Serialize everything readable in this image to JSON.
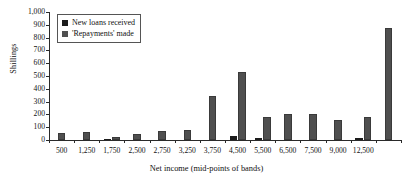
{
  "chart_data": {
    "type": "bar",
    "title": "",
    "xlabel": "Net income (mid-points of bands)",
    "ylabel": "Shillings",
    "ylim": [
      0,
      1000
    ],
    "yticks": [
      "0",
      "100",
      "200",
      "300",
      "400",
      "500",
      "600",
      "700",
      "800",
      "900",
      "1,000"
    ],
    "grid": false,
    "legend_position": "top-left",
    "categories": [
      "500",
      "1,250",
      "1,750",
      "2,500",
      "2,750",
      "3,250",
      "3,750",
      "4,500",
      "5,500",
      "6,500",
      "7,500",
      "9,000",
      "12,500",
      ""
    ],
    "series": [
      {
        "name": "New loans received",
        "color": "#1c1c1c",
        "values": [
          0,
          0,
          9,
          0,
          0,
          0,
          0,
          28,
          12,
          0,
          0,
          0,
          19,
          0
        ]
      },
      {
        "name": "'Repayments' made",
        "color": "#4f4f4f",
        "values": [
          54,
          66,
          24,
          48,
          72,
          80,
          345,
          533,
          178,
          207,
          203,
          157,
          180,
          875
        ]
      }
    ]
  },
  "legend": {
    "items": [
      {
        "label": "New loans received"
      },
      {
        "label": "'Repayments' made"
      }
    ]
  },
  "axes": {
    "y_title": "Shillings",
    "x_title": "Net income (mid-points of bands)"
  }
}
